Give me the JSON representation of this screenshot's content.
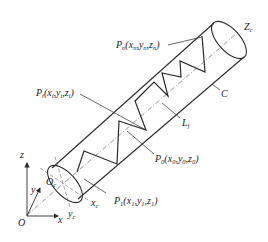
{
  "figure": {
    "labels": {
      "Pn": {
        "main": "P",
        "sub": "n",
        "rest": "(x",
        "xs": "n",
        "c1": ",y",
        "ys": "n",
        "c2": ",z",
        "zs": "n",
        "end": ")"
      },
      "Pi": {
        "main": "P",
        "sub": "i",
        "rest": "(x",
        "xs": "i",
        "c1": ",y",
        "ys": "i",
        "c2": ",z",
        "zs": "i",
        "end": ")"
      },
      "P0": {
        "main": "P",
        "sub": "0",
        "rest": "(x",
        "xs": "0",
        "c1": ",y",
        "ys": "0",
        "c2": ",z",
        "zs": "0",
        "end": ")"
      },
      "P1": {
        "main": "P",
        "sub": "1",
        "rest": "(x",
        "xs": "1",
        "c1": ",y",
        "ys": "1",
        "c2": ",z",
        "zs": "1",
        "end": ")"
      },
      "Zc": {
        "main": "Z",
        "sub": "c"
      },
      "C": {
        "main": "C"
      },
      "Lf": {
        "main": "L",
        "sub": "f"
      },
      "Oc": {
        "main": "O",
        "sub": "c"
      },
      "xc": {
        "main": "x",
        "sub": "c"
      },
      "yc": {
        "main": "y",
        "sub": "c"
      },
      "O": {
        "main": "O"
      },
      "x": {
        "main": "x"
      },
      "y": {
        "main": "y"
      },
      "z": {
        "main": "z"
      }
    },
    "colors": {
      "line": "#2a2a2a",
      "dash": "#666666",
      "background": "#ffffff"
    }
  }
}
